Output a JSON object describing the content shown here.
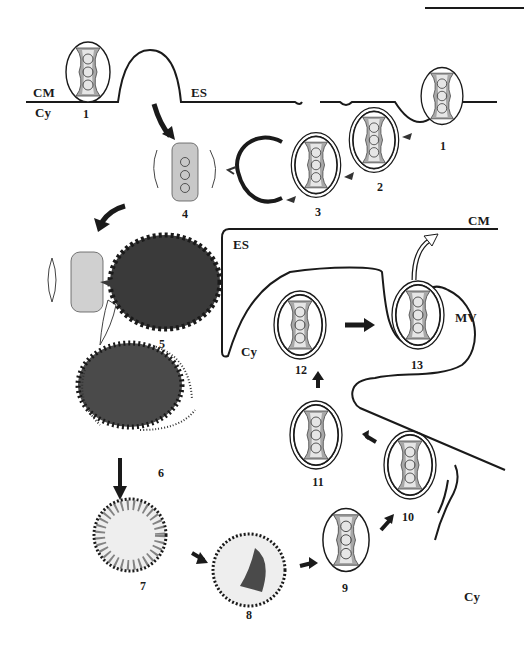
{
  "figure": {
    "region_labels": {
      "cm_top": "CM",
      "cy_top": "Cy",
      "es_top": "ES",
      "cm_mid": "CM",
      "es_mid": "ES",
      "cy_mid": "Cy",
      "mv": "MV",
      "cy_bottom": "Cy"
    },
    "stage_labels": {
      "s1_left": "1",
      "s1_right": "1",
      "s2": "2",
      "s3": "3",
      "s4": "4",
      "s5": "5",
      "s6": "6",
      "s7": "7",
      "s8": "8",
      "s9": "9",
      "s10": "10",
      "s11": "11",
      "s12": "12",
      "s13": "13"
    },
    "colors": {
      "ink": "#1a1a1a",
      "fill_dark": "#3a3a3a",
      "fill_stipple": "#9a9a9a",
      "background": "#ffffff"
    }
  }
}
